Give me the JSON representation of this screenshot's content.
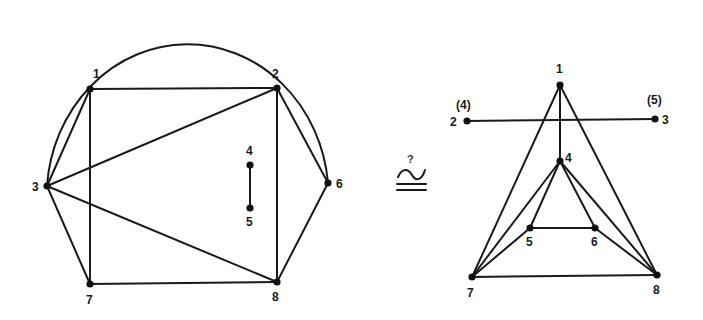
{
  "figure": {
    "relation_symbol": "≅",
    "relation_question": "?",
    "colors": {
      "stroke": "#1a1a1a",
      "node": "#111111",
      "background": "#ffffff"
    }
  },
  "left_graph": {
    "nodes": [
      {
        "id": "1",
        "label": "1",
        "x": 90,
        "y": 89,
        "lx": 93,
        "ly": 78
      },
      {
        "id": "2",
        "label": "2",
        "x": 277,
        "y": 88,
        "lx": 272,
        "ly": 78
      },
      {
        "id": "3",
        "label": "3",
        "x": 47,
        "y": 186,
        "lx": 32,
        "ly": 191
      },
      {
        "id": "4",
        "label": "4",
        "x": 250,
        "y": 165,
        "lx": 246,
        "ly": 155
      },
      {
        "id": "5",
        "label": "5",
        "x": 250,
        "y": 208,
        "lx": 246,
        "ly": 226
      },
      {
        "id": "6",
        "label": "6",
        "x": 328,
        "y": 183,
        "lx": 336,
        "ly": 188
      },
      {
        "id": "7",
        "label": "7",
        "x": 90,
        "y": 284,
        "lx": 86,
        "ly": 304
      },
      {
        "id": "8",
        "label": "8",
        "x": 277,
        "y": 282,
        "lx": 272,
        "ly": 301
      }
    ],
    "edges": [
      [
        "1",
        "2"
      ],
      [
        "1",
        "3"
      ],
      [
        "1",
        "7"
      ],
      [
        "2",
        "3"
      ],
      [
        "2",
        "6"
      ],
      [
        "2",
        "8"
      ],
      [
        "3",
        "7"
      ],
      [
        "3",
        "8"
      ],
      [
        "4",
        "5"
      ],
      [
        "6",
        "8"
      ],
      [
        "7",
        "8"
      ]
    ],
    "arc_edge": {
      "from": "3",
      "to": "6",
      "rx": 141,
      "ry": 153
    }
  },
  "right_graph": {
    "nodes": [
      {
        "id": "1",
        "label": "1",
        "x": 560,
        "y": 85,
        "lx": 556,
        "ly": 73
      },
      {
        "id": "2",
        "label": "2",
        "x": 467,
        "y": 121,
        "lx": 450,
        "ly": 126,
        "alt_label": "(4)",
        "alx": 456,
        "aly": 109
      },
      {
        "id": "3",
        "label": "3",
        "x": 655,
        "y": 119,
        "lx": 662,
        "ly": 124,
        "alt_label": "(5)",
        "alx": 647,
        "aly": 104
      },
      {
        "id": "4",
        "label": "4",
        "x": 560,
        "y": 161,
        "lx": 565,
        "ly": 162
      },
      {
        "id": "5",
        "label": "5",
        "x": 530,
        "y": 228,
        "lx": 526,
        "ly": 246
      },
      {
        "id": "6",
        "label": "6",
        "x": 595,
        "y": 228,
        "lx": 591,
        "ly": 246
      },
      {
        "id": "7",
        "label": "7",
        "x": 472,
        "y": 277,
        "lx": 467,
        "ly": 297
      },
      {
        "id": "8",
        "label": "8",
        "x": 657,
        "y": 275,
        "lx": 653,
        "ly": 294
      }
    ],
    "edges": [
      [
        "1",
        "7"
      ],
      [
        "1",
        "8"
      ],
      [
        "1",
        "4"
      ],
      [
        "2",
        "3"
      ],
      [
        "4",
        "5"
      ],
      [
        "4",
        "6"
      ],
      [
        "4",
        "7"
      ],
      [
        "4",
        "8"
      ],
      [
        "5",
        "6"
      ],
      [
        "5",
        "7"
      ],
      [
        "6",
        "8"
      ],
      [
        "7",
        "8"
      ]
    ]
  },
  "symbol_pos": {
    "x": 411,
    "y": 178,
    "qx": 408,
    "qy": 162
  }
}
